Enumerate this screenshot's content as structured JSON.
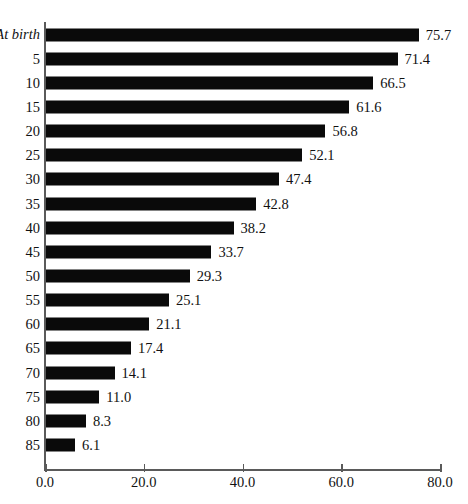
{
  "chart_data": {
    "type": "bar",
    "orientation": "horizontal",
    "title": "",
    "xlabel": "",
    "ylabel": "",
    "categories": [
      "At birth",
      "5",
      "10",
      "15",
      "20",
      "25",
      "30",
      "35",
      "40",
      "45",
      "50",
      "55",
      "60",
      "65",
      "70",
      "75",
      "80",
      "85"
    ],
    "values": [
      75.7,
      71.4,
      66.5,
      61.6,
      56.8,
      52.1,
      47.4,
      42.8,
      38.2,
      33.7,
      29.3,
      25.1,
      21.1,
      17.4,
      14.1,
      11.0,
      8.3,
      6.1
    ],
    "value_labels": [
      "75.7",
      "71.4",
      "66.5",
      "61.6",
      "56.8",
      "52.1",
      "47.4",
      "42.8",
      "38.2",
      "33.7",
      "29.3",
      "25.1",
      "21.1",
      "17.4",
      "14.1",
      "11.0",
      "8.3",
      "6.1"
    ],
    "xlim": [
      0.0,
      80.0
    ],
    "xticks": [
      0.0,
      20.0,
      40.0,
      60.0,
      80.0
    ],
    "xtick_labels": [
      "0.0",
      "20.0",
      "40.0",
      "60.0",
      "80.0"
    ],
    "grid": false,
    "legend": false,
    "bar_color": "#0a0a0a",
    "axis_color": "#5a5a5a"
  }
}
